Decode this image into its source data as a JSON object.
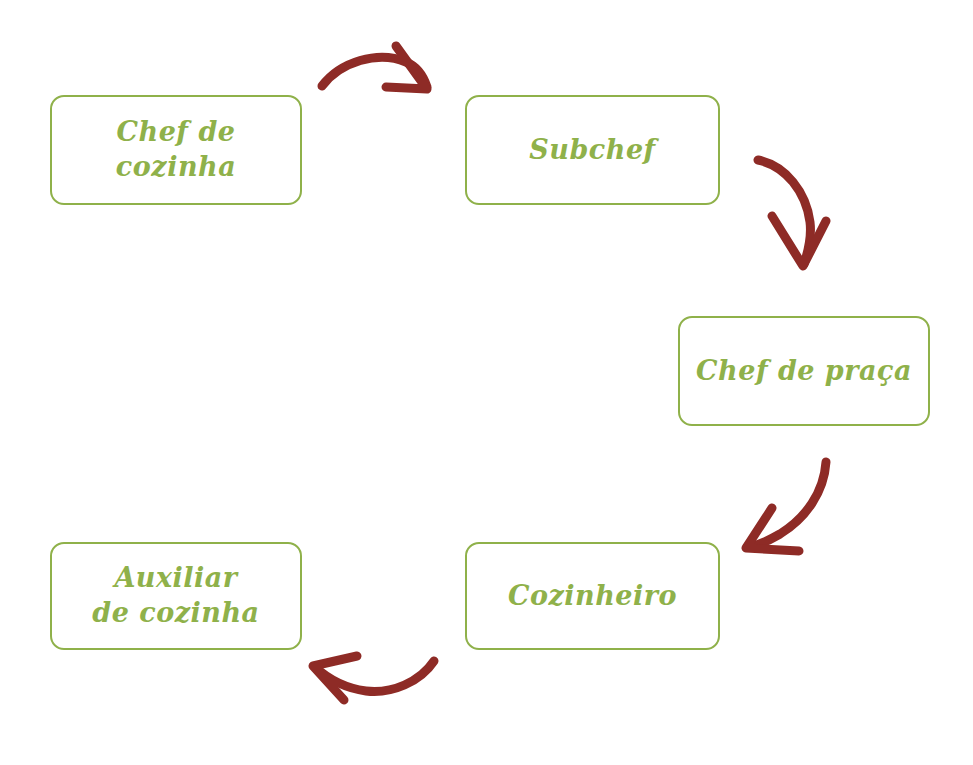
{
  "diagram": {
    "type": "cycle-flow",
    "title": "",
    "colors": {
      "node_border": "#8fb14a",
      "node_text": "#8fb14a",
      "arrow": "#8e2b26",
      "background": "#ffffff"
    },
    "nodes": [
      {
        "id": "chef-de-cozinha",
        "label": "Chef de cozinha"
      },
      {
        "id": "subchef",
        "label": "Subchef"
      },
      {
        "id": "chef-de-praca",
        "label": "Chef de praça"
      },
      {
        "id": "cozinheiro",
        "label": "Cozinheiro"
      },
      {
        "id": "auxiliar-de-cozinha",
        "label": "Auxiliar\nde cozinha"
      }
    ],
    "arrows": [
      {
        "id": "arrow-top",
        "from": "chef-de-cozinha",
        "to": "subchef",
        "direction": "right"
      },
      {
        "id": "arrow-right-upper",
        "from": "subchef",
        "to": "chef-de-praca",
        "direction": "down"
      },
      {
        "id": "arrow-right-lower",
        "from": "chef-de-praca",
        "to": "cozinheiro",
        "direction": "down-left"
      },
      {
        "id": "arrow-bottom",
        "from": "cozinheiro",
        "to": "auxiliar-de-cozinha",
        "direction": "left"
      }
    ]
  }
}
